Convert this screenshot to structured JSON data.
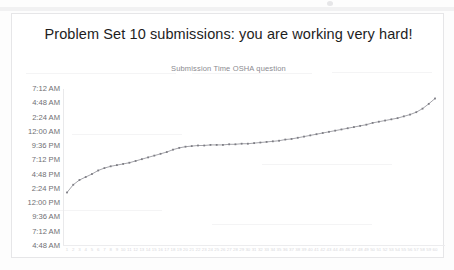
{
  "document": {
    "background_color": "#fdfdfd",
    "frame_border_color": "#e6e6e8"
  },
  "chart_data": {
    "type": "line",
    "title": "Problem Set 10 submissions: you are working very hard!",
    "subtitle": "Submission Time OSHA question",
    "xlabel": "",
    "ylabel": "",
    "grid": false,
    "legend": false,
    "legend_position": "none",
    "line_color": "#9a9aa0",
    "marker_color": "#7d7d84",
    "marker_shape": "square",
    "ytick_labels": [
      "7:12 AM",
      "4:48 AM",
      "2:24 AM",
      "12:00 AM",
      "9:36 PM",
      "7:12 PM",
      "4:48 PM",
      "2:24 PM",
      "12:00 PM",
      "9:36 AM",
      "7:12 AM",
      "4:48 AM"
    ],
    "ylim_labels": [
      "4:48 AM",
      "7:12 AM"
    ],
    "ytick_values_hours": [
      31.2,
      28.8,
      26.4,
      24.0,
      21.6,
      19.2,
      16.8,
      14.4,
      12.0,
      9.6,
      7.2,
      4.8
    ],
    "categories": [
      "1",
      "2",
      "3",
      "4",
      "5",
      "6",
      "7",
      "8",
      "9",
      "10",
      "11",
      "12",
      "13",
      "14",
      "15",
      "16",
      "17",
      "18",
      "19",
      "20",
      "21",
      "22",
      "23",
      "24",
      "25",
      "26",
      "27",
      "28",
      "29",
      "30",
      "31",
      "32",
      "33",
      "34",
      "35",
      "36",
      "37",
      "38",
      "39",
      "40",
      "41",
      "42",
      "43",
      "44",
      "45",
      "46",
      "47",
      "48",
      "49",
      "50",
      "51",
      "52",
      "53",
      "54",
      "55",
      "56",
      "57",
      "58",
      "59",
      "60"
    ],
    "values": [
      13.8,
      15.1,
      15.9,
      16.4,
      16.9,
      17.5,
      17.9,
      18.2,
      18.4,
      18.6,
      18.8,
      19.1,
      19.4,
      19.7,
      20.0,
      20.3,
      20.6,
      21.0,
      21.3,
      21.5,
      21.6,
      21.7,
      21.7,
      21.8,
      21.8,
      21.8,
      21.9,
      21.9,
      22.0,
      22.0,
      22.1,
      22.2,
      22.3,
      22.4,
      22.5,
      22.7,
      22.8,
      23.0,
      23.2,
      23.4,
      23.6,
      23.8,
      24.0,
      24.2,
      24.4,
      24.6,
      24.8,
      25.0,
      25.2,
      25.5,
      25.7,
      25.9,
      26.1,
      26.3,
      26.6,
      26.9,
      27.3,
      27.9,
      28.7,
      29.6
    ],
    "value_unit": "hours since 4:48 AM baseline (submission time)",
    "note": "Cumulative submission times rise steeply at the start, plateau near 9:36 PM, climb gradually, then spike sharply at the end."
  }
}
